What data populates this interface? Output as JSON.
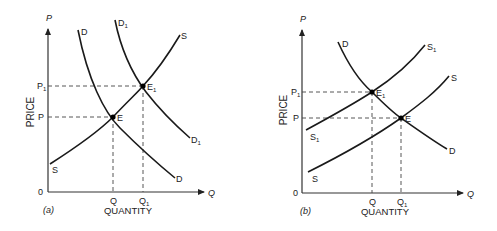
{
  "panels": [
    {
      "id": "a",
      "caption": "(a)",
      "y_axis_symbol": "P",
      "x_axis_symbol": "Q",
      "y_axis_title": "PRICE",
      "x_axis_title": "QUANTITY",
      "origin_label": "0",
      "price_ticks": [
        "P1",
        "P"
      ],
      "quantity_ticks": [
        "Q",
        "Q1"
      ],
      "curves": [
        {
          "name": "D",
          "label_top": "D",
          "label_bottom": "D"
        },
        {
          "name": "D1",
          "label_top": "D1",
          "label_bottom": "D1"
        },
        {
          "name": "S",
          "label_top": "S",
          "label_bottom": "S"
        }
      ],
      "equilibria": [
        {
          "label": "E",
          "price": "P",
          "quantity": "Q"
        },
        {
          "label": "E1",
          "price": "P1",
          "quantity": "Q1"
        }
      ]
    },
    {
      "id": "b",
      "caption": "(b)",
      "y_axis_symbol": "P",
      "x_axis_symbol": "Q",
      "y_axis_title": "PRICE",
      "x_axis_title": "QUANTITY",
      "origin_label": "0",
      "price_ticks": [
        "P1",
        "P"
      ],
      "quantity_ticks": [
        "Q",
        "Q1"
      ],
      "curves": [
        {
          "name": "D",
          "label_top": "D",
          "label_bottom": "D"
        },
        {
          "name": "S1",
          "label_top": "S1",
          "label_bottom": "S1"
        },
        {
          "name": "S",
          "label_top": "S",
          "label_bottom": "S"
        }
      ],
      "equilibria": [
        {
          "label": "E1",
          "price": "P1",
          "quantity": "Q"
        },
        {
          "label": "E",
          "price": "P",
          "quantity": "Q1"
        }
      ]
    }
  ],
  "labels": {
    "a": {
      "caption": "(a)",
      "P_axis": "P",
      "Q_axis": "Q",
      "price": "PRICE",
      "quantity": "QUANTITY",
      "zero": "0",
      "P1": "P",
      "P1_sub": "1",
      "P": "P",
      "Q": "Q",
      "Q1": "Q",
      "Q1_sub": "1",
      "D_top": "D",
      "D_bot": "D",
      "D1_top": "D",
      "D1_top_sub": "1",
      "D1_bot": "D",
      "D1_bot_sub": "1",
      "S_top": "S",
      "S_bot": "S",
      "E": "E",
      "E1": "E",
      "E1_sub": "1"
    },
    "b": {
      "caption": "(b)",
      "P_axis": "P",
      "Q_axis": "Q",
      "price": "PRICE",
      "quantity": "QUANTITY",
      "zero": "0",
      "P1": "P",
      "P1_sub": "1",
      "P": "P",
      "Q": "Q",
      "Q1": "Q",
      "Q1_sub": "1",
      "D_top": "D",
      "D_bot": "D",
      "S1_top": "S",
      "S1_top_sub": "1",
      "S1_bot": "S",
      "S1_bot_sub": "1",
      "S_top": "S",
      "S_bot": "S",
      "E": "E",
      "E1": "E",
      "E1_sub": "1"
    }
  }
}
